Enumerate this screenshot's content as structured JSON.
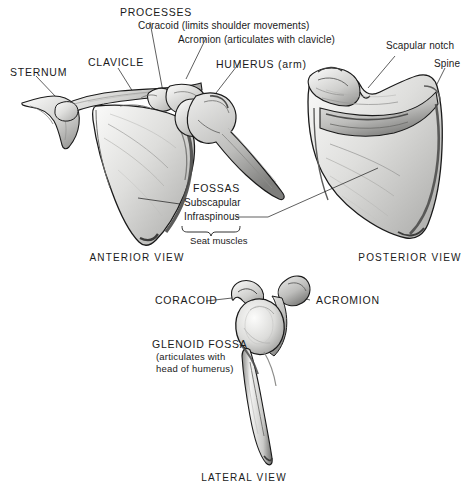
{
  "figure": {
    "title_visible": false,
    "background": "#ffffff",
    "ink": "#1a1a1a"
  },
  "labels": {
    "processes_heading": "PROCESSES",
    "coracoid_process": "Coracoid (limits shoulder movements)",
    "acromion_process": "Acromion (articulates with clavicle)",
    "humerus": "HUMERUS (arm)",
    "clavicle": "CLAVICLE",
    "sternum": "STERNUM",
    "scapular_notch": "Scapular notch",
    "spine": "Spine",
    "fossas_heading": "FOSSAS",
    "fossa_subscapular": "Subscapular",
    "fossa_infraspinous": "Infraspinous",
    "seat_muscles": "Seat muscles",
    "coracoid_lateral": "CORACOID",
    "acromion_lateral": "ACROMION",
    "glenoid_fossa": "GLENOID FOSSA",
    "glenoid_note_line1": "(articulates with",
    "glenoid_note_line2": "head of humerus)"
  },
  "views": {
    "anterior": "ANTERIOR VIEW",
    "posterior": "POSTERIOR VIEW",
    "lateral": "LATERAL VIEW"
  },
  "colors": {
    "outline": "#1a1a1a",
    "bone_light": "#f2f2f1",
    "bone_mid": "#c9c9c7",
    "bone_shadow": "#8d8d8b",
    "bone_deep": "#5d5d5c",
    "leader": "#1a1a1a"
  },
  "icon_names": [
    "scapula-anterior-illustration",
    "scapula-posterior-illustration",
    "scapula-lateral-illustration",
    "leader-line",
    "brace-bracket"
  ]
}
